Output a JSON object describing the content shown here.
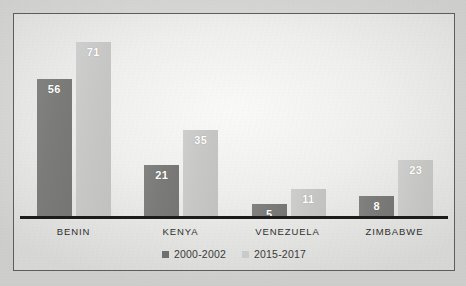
{
  "chart_data": {
    "type": "bar",
    "title": "",
    "subtitle": "",
    "xlabel": "",
    "ylabel": "",
    "categories": [
      "BENIN",
      "KENYA",
      "VENEZUELA",
      "ZIMBABWE"
    ],
    "series": [
      {
        "name": "2000-2002",
        "color": "#7a7a78",
        "values": [
          56,
          21,
          5,
          8
        ]
      },
      {
        "name": "2015-2017",
        "color": "#c8c8c6",
        "values": [
          71,
          35,
          11,
          23
        ]
      }
    ],
    "ylim": [
      0,
      80
    ],
    "grid": false,
    "legend_position": "bottom",
    "value_labels": true,
    "value_label_color": "#ffffff",
    "axis_color": "#1c1c1c",
    "frame_color": "#5d5d5d",
    "background_color": "#e9e9e7"
  }
}
